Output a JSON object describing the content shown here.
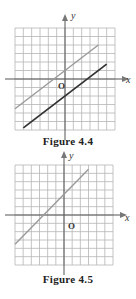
{
  "figures": [
    {
      "caption": "Figure 4.4",
      "axis_x_label": "x",
      "axis_y_label": "y",
      "origin_label": "O",
      "grid": {
        "x_min": -6,
        "x_max": 6,
        "y_min": -6,
        "y_max": 6
      },
      "lines": [
        {
          "name": "upper-line",
          "slope": 0.75,
          "intercept": 1,
          "color": "#9a9a9a",
          "x_from": -6,
          "x_to": 4
        },
        {
          "name": "lower-line",
          "slope": 0.75,
          "intercept": -2,
          "color": "#333333",
          "x_from": -5,
          "x_to": 5
        }
      ]
    },
    {
      "caption": "Figure 4.5",
      "axis_x_label": "x",
      "axis_y_label": "y",
      "origin_label": "O",
      "grid": {
        "x_min": -6,
        "x_max": 6,
        "y_min": -6,
        "y_max": 6
      },
      "lines": [
        {
          "name": "line",
          "slope": 1,
          "intercept": 2.5,
          "color": "#9a9a9a",
          "x_from": -6,
          "x_to": 3
        }
      ]
    }
  ],
  "chart_data": [
    {
      "type": "line",
      "title": "Figure 4.4",
      "xlabel": "x",
      "ylabel": "y",
      "xlim": [
        -6,
        6
      ],
      "ylim": [
        -6,
        6
      ],
      "grid": true,
      "series": [
        {
          "name": "upper line (gray)",
          "x": [
            -6,
            4
          ],
          "y": [
            -3.5,
            4
          ]
        },
        {
          "name": "lower line (dark)",
          "x": [
            -5,
            5
          ],
          "y": [
            -5.75,
            1.75
          ]
        }
      ],
      "annotations": [
        "O"
      ]
    },
    {
      "type": "line",
      "title": "Figure 4.5",
      "xlabel": "x",
      "ylabel": "y",
      "xlim": [
        -6,
        6
      ],
      "ylim": [
        -6,
        6
      ],
      "grid": true,
      "series": [
        {
          "name": "line",
          "x": [
            -6,
            3
          ],
          "y": [
            -3.5,
            5.5
          ]
        }
      ],
      "annotations": [
        "O"
      ]
    }
  ]
}
